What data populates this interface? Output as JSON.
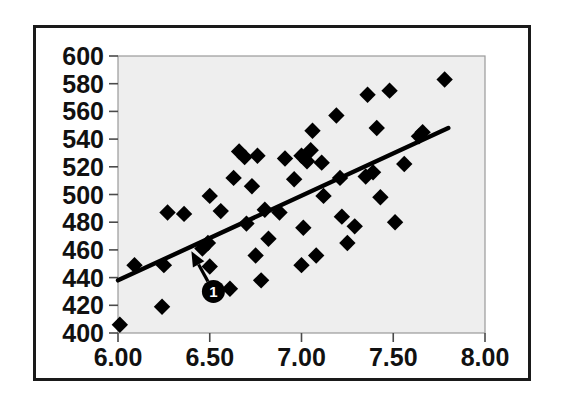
{
  "figure": {
    "background_color": "#ffffff",
    "frame_color": "#1a1a1a",
    "plot_background_color": "#eeeeee",
    "marker_color": "#000000",
    "line_color": "#000000"
  },
  "chart_data": {
    "type": "scatter",
    "title": "",
    "subtitle": "",
    "xlabel": "",
    "ylabel": "",
    "xlim": [
      6.0,
      8.0
    ],
    "ylim": [
      400,
      600
    ],
    "xticks": [
      6.0,
      6.5,
      7.0,
      7.5,
      8.0
    ],
    "yticks": [
      400,
      420,
      440,
      460,
      480,
      500,
      520,
      540,
      560,
      580,
      600
    ],
    "xtick_labels": [
      "6.00",
      "6.50",
      "7.00",
      "7.50",
      "8.00"
    ],
    "ytick_labels": [
      "400",
      "420",
      "440",
      "460",
      "480",
      "500",
      "520",
      "540",
      "560",
      "580",
      "600"
    ],
    "grid": false,
    "legend": null,
    "marker_shape": "diamond",
    "series": [
      {
        "name": "observations",
        "marker": "diamond",
        "points": [
          [
            6.01,
            406
          ],
          [
            6.09,
            449
          ],
          [
            6.24,
            419
          ],
          [
            6.25,
            449
          ],
          [
            6.27,
            487
          ],
          [
            6.36,
            486
          ],
          [
            6.46,
            461
          ],
          [
            6.49,
            465
          ],
          [
            6.5,
            448
          ],
          [
            6.5,
            499
          ],
          [
            6.56,
            488
          ],
          [
            6.61,
            432
          ],
          [
            6.63,
            512
          ],
          [
            6.66,
            531
          ],
          [
            6.69,
            527
          ],
          [
            6.7,
            479
          ],
          [
            6.73,
            506
          ],
          [
            6.75,
            456
          ],
          [
            6.76,
            528
          ],
          [
            6.78,
            438
          ],
          [
            6.8,
            489
          ],
          [
            6.82,
            468
          ],
          [
            6.88,
            487
          ],
          [
            6.91,
            526
          ],
          [
            6.96,
            511
          ],
          [
            7.0,
            449
          ],
          [
            7.0,
            528
          ],
          [
            7.01,
            476
          ],
          [
            7.03,
            524
          ],
          [
            7.05,
            532
          ],
          [
            7.06,
            546
          ],
          [
            7.08,
            456
          ],
          [
            7.11,
            523
          ],
          [
            7.12,
            499
          ],
          [
            7.19,
            557
          ],
          [
            7.21,
            512
          ],
          [
            7.22,
            484
          ],
          [
            7.25,
            465
          ],
          [
            7.29,
            477
          ],
          [
            7.35,
            513
          ],
          [
            7.36,
            572
          ],
          [
            7.39,
            516
          ],
          [
            7.41,
            548
          ],
          [
            7.43,
            498
          ],
          [
            7.48,
            575
          ],
          [
            7.51,
            480
          ],
          [
            7.56,
            522
          ],
          [
            7.64,
            542
          ],
          [
            7.66,
            545
          ],
          [
            7.78,
            583
          ]
        ]
      }
    ],
    "fit_line": {
      "name": "regression-line",
      "x_start": 6.0,
      "y_start": 438,
      "x_end": 7.8,
      "y_end": 548
    },
    "annotations": [
      {
        "label": "1",
        "marker_type": "numbered-callout",
        "circle_x": 6.52,
        "circle_y": 430,
        "arrow_target_x": 6.4,
        "arrow_target_y": 459
      }
    ]
  }
}
